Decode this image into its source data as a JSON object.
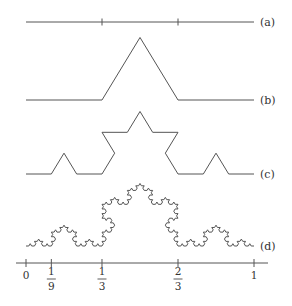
{
  "figure": {
    "stages": [
      {
        "label": "(a)",
        "iteration": 0,
        "tick_marks_at": [
          "1/3",
          "2/3"
        ]
      },
      {
        "label": "(b)",
        "iteration": 1
      },
      {
        "label": "(c)",
        "iteration": 2
      },
      {
        "label": "(d)",
        "iteration": 4
      }
    ],
    "axis": {
      "ticks": [
        {
          "value": 0,
          "label": "0",
          "type": "integer"
        },
        {
          "value": 0.1111,
          "numerator": "1",
          "denominator": "9",
          "type": "fraction"
        },
        {
          "value": 0.3333,
          "numerator": "1",
          "denominator": "3",
          "type": "fraction"
        },
        {
          "value": 0.6667,
          "numerator": "2",
          "denominator": "3",
          "type": "fraction"
        },
        {
          "value": 1,
          "label": "1",
          "type": "integer"
        }
      ]
    }
  }
}
